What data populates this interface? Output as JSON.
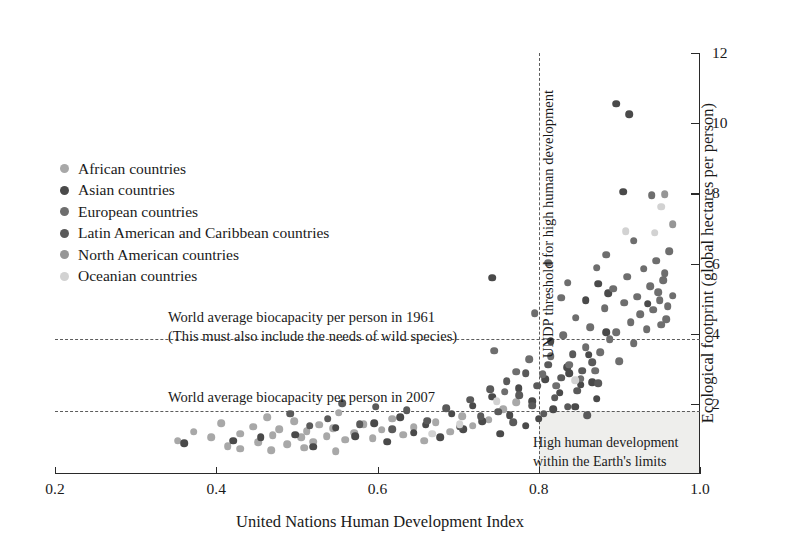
{
  "chart_data": {
    "type": "scatter",
    "title": "",
    "xlabel": "United Nations Human Development Index",
    "ylabel": "Ecological footprint (global hectares per person)",
    "xlim": [
      0.2,
      1.0
    ],
    "ylim": [
      0,
      12
    ],
    "xticks": [
      "0.2",
      "0.4",
      "0.6",
      "0.8",
      "1.0"
    ],
    "xtick_values": [
      0.2,
      0.4,
      0.6,
      0.8,
      1.0
    ],
    "yticks": [
      "2",
      "4",
      "6",
      "8",
      "10",
      "12"
    ],
    "ytick_values": [
      2,
      4,
      6,
      8,
      10,
      12
    ],
    "grid": false,
    "legend_position": "upper-left",
    "series": [
      {
        "name": "African countries",
        "color": "#a8a8a8",
        "points": [
          [
            0.352,
            0.95
          ],
          [
            0.372,
            1.2
          ],
          [
            0.394,
            1.05
          ],
          [
            0.406,
            1.45
          ],
          [
            0.414,
            0.8
          ],
          [
            0.43,
            1.15
          ],
          [
            0.446,
            1.35
          ],
          [
            0.452,
            0.9
          ],
          [
            0.463,
            1.62
          ],
          [
            0.47,
            1.1
          ],
          [
            0.478,
            1.28
          ],
          [
            0.488,
            0.85
          ],
          [
            0.497,
            1.5
          ],
          [
            0.505,
            1.05
          ],
          [
            0.512,
            1.22
          ],
          [
            0.52,
            0.92
          ],
          [
            0.528,
            1.4
          ],
          [
            0.537,
            1.08
          ],
          [
            0.545,
            1.3
          ],
          [
            0.552,
            1.75
          ],
          [
            0.56,
            0.98
          ],
          [
            0.571,
            1.18
          ],
          [
            0.583,
            1.42
          ],
          [
            0.594,
            1.02
          ],
          [
            0.605,
            1.26
          ],
          [
            0.618,
            1.58
          ],
          [
            0.632,
            1.12
          ],
          [
            0.645,
            1.34
          ],
          [
            0.658,
            0.95
          ],
          [
            0.672,
            1.48
          ],
          [
            0.69,
            1.2
          ],
          [
            0.705,
            1.65
          ],
          [
            0.718,
            1.38
          ],
          [
            0.738,
            1.55
          ],
          [
            0.756,
            1.85
          ],
          [
            0.772,
            2.05
          ],
          [
            0.43,
            0.72
          ],
          [
            0.468,
            0.68
          ],
          [
            0.509,
            0.75
          ],
          [
            0.548,
            0.65
          ]
        ]
      },
      {
        "name": "Asian countries",
        "color": "#4a4a4a",
        "points": [
          [
            0.36,
            0.88
          ],
          [
            0.421,
            0.95
          ],
          [
            0.455,
            1.05
          ],
          [
            0.498,
            1.12
          ],
          [
            0.52,
            0.78
          ],
          [
            0.548,
            1.32
          ],
          [
            0.572,
            1.08
          ],
          [
            0.596,
            1.45
          ],
          [
            0.612,
            0.92
          ],
          [
            0.628,
            1.62
          ],
          [
            0.645,
            1.18
          ],
          [
            0.66,
            1.4
          ],
          [
            0.678,
            1.05
          ],
          [
            0.692,
            1.72
          ],
          [
            0.706,
            1.28
          ],
          [
            0.718,
            1.95
          ],
          [
            0.73,
            1.5
          ],
          [
            0.742,
            2.2
          ],
          [
            0.752,
            1.15
          ],
          [
            0.764,
            1.68
          ],
          [
            0.775,
            2.45
          ],
          [
            0.784,
            1.38
          ],
          [
            0.792,
            2.08
          ],
          [
            0.8,
            1.58
          ],
          [
            0.808,
            2.7
          ],
          [
            0.818,
            1.85
          ],
          [
            0.826,
            2.32
          ],
          [
            0.835,
            3.05
          ],
          [
            0.845,
            1.92
          ],
          [
            0.852,
            2.55
          ],
          [
            0.862,
            3.4
          ],
          [
            0.872,
            2.15
          ],
          [
            0.884,
            4.05
          ],
          [
            0.896,
            10.55
          ],
          [
            0.912,
            10.25
          ],
          [
            0.905,
            8.05
          ],
          [
            0.858,
            4.95
          ],
          [
            0.874,
            5.42
          ],
          [
            0.886,
            5.15
          ],
          [
            0.935,
            4.85
          ],
          [
            0.742,
            5.6
          ],
          [
            0.815,
            3.78
          ],
          [
            0.838,
            2.88
          ],
          [
            0.866,
            2.62
          ]
        ]
      },
      {
        "name": "European countries",
        "color": "#6e6e6e",
        "points": [
          [
            0.805,
            2.85
          ],
          [
            0.815,
            3.35
          ],
          [
            0.822,
            2.52
          ],
          [
            0.83,
            3.95
          ],
          [
            0.838,
            3.12
          ],
          [
            0.846,
            4.45
          ],
          [
            0.852,
            2.72
          ],
          [
            0.858,
            3.62
          ],
          [
            0.864,
            4.18
          ],
          [
            0.87,
            2.95
          ],
          [
            0.876,
            3.48
          ],
          [
            0.882,
            4.72
          ],
          [
            0.888,
            3.85
          ],
          [
            0.892,
            5.28
          ],
          [
            0.896,
            4.05
          ],
          [
            0.9,
            3.22
          ],
          [
            0.906,
            4.88
          ],
          [
            0.91,
            5.62
          ],
          [
            0.914,
            4.32
          ],
          [
            0.918,
            3.72
          ],
          [
            0.922,
            5.05
          ],
          [
            0.926,
            4.55
          ],
          [
            0.93,
            5.85
          ],
          [
            0.934,
            4.12
          ],
          [
            0.938,
            5.35
          ],
          [
            0.942,
            4.68
          ],
          [
            0.946,
            6.08
          ],
          [
            0.95,
            4.95
          ],
          [
            0.954,
            5.52
          ],
          [
            0.958,
            4.42
          ],
          [
            0.94,
            7.95
          ],
          [
            0.948,
            5.18
          ],
          [
            0.952,
            4.25
          ],
          [
            0.956,
            5.72
          ],
          [
            0.96,
            4.78
          ],
          [
            0.962,
            6.35
          ],
          [
            0.966,
            5.08
          ],
          [
            0.884,
            6.25
          ],
          [
            0.872,
            5.88
          ],
          [
            0.828,
            5.02
          ],
          [
            0.795,
            4.58
          ],
          [
            0.788,
            3.28
          ],
          [
            0.772,
            2.92
          ],
          [
            0.758,
            2.35
          ],
          [
            0.745,
            3.52
          ],
          [
            0.812,
            6.02
          ],
          [
            0.836,
            5.45
          ],
          [
            0.918,
            6.65
          ]
        ]
      },
      {
        "name": "Latin American and Caribbean countries",
        "color": "#5a5a5a",
        "points": [
          [
            0.662,
            1.52
          ],
          [
            0.685,
            1.88
          ],
          [
            0.702,
            1.35
          ],
          [
            0.715,
            2.12
          ],
          [
            0.728,
            1.65
          ],
          [
            0.74,
            2.42
          ],
          [
            0.75,
            1.78
          ],
          [
            0.76,
            2.65
          ],
          [
            0.768,
            1.48
          ],
          [
            0.776,
            2.25
          ],
          [
            0.784,
            2.88
          ],
          [
            0.792,
            1.95
          ],
          [
            0.798,
            2.52
          ],
          [
            0.806,
            1.72
          ],
          [
            0.812,
            3.12
          ],
          [
            0.82,
            2.18
          ],
          [
            0.828,
            2.75
          ],
          [
            0.836,
            1.92
          ],
          [
            0.842,
            3.42
          ],
          [
            0.848,
            2.38
          ],
          [
            0.854,
            2.95
          ],
          [
            0.86,
            1.68
          ],
          [
            0.866,
            3.18
          ],
          [
            0.874,
            2.58
          ],
          [
            0.636,
            1.82
          ],
          [
            0.618,
            1.28
          ],
          [
            0.598,
            1.92
          ],
          [
            0.578,
            1.42
          ],
          [
            0.556,
            2.02
          ],
          [
            0.538,
            1.58
          ],
          [
            0.516,
            1.38
          ],
          [
            0.492,
            1.72
          ]
        ]
      },
      {
        "name": "North American countries",
        "color": "#969696",
        "points": [
          [
            0.956,
            7.98
          ],
          [
            0.966,
            7.12
          ]
        ]
      },
      {
        "name": "Oceanian countries",
        "color": "#d2d2d2",
        "points": [
          [
            0.944,
            6.88
          ],
          [
            0.952,
            7.62
          ],
          [
            0.908,
            6.92
          ],
          [
            0.748,
            2.08
          ],
          [
            0.702,
            1.42
          ],
          [
            0.668,
            1.15
          ],
          [
            0.845,
            2.68
          ]
        ]
      }
    ],
    "reference_lines": [
      {
        "name": "world-biocapacity-1961",
        "orientation": "horizontal",
        "value": 3.85,
        "style": "dashed",
        "label": "World average biocapacity per person in 1961\n(This must also include the needs of wild species)"
      },
      {
        "name": "world-biocapacity-2007",
        "orientation": "horizontal",
        "value": 1.8,
        "style": "dashed",
        "label": "World average biocapacity per person in 2007"
      },
      {
        "name": "undp-threshold",
        "orientation": "vertical",
        "value": 0.8,
        "style": "dashed",
        "label": "UNDP threshold for high human development"
      }
    ],
    "annotations": [
      {
        "name": "biocapacity-1961-note-line1",
        "text": "World average biocapacity per person in 1961"
      },
      {
        "name": "biocapacity-1961-note-line2",
        "text": "(This must also include the needs of wild species)"
      },
      {
        "name": "biocapacity-2007-note",
        "text": "World average biocapacity per person in 2007"
      },
      {
        "name": "undp-threshold-note",
        "text": "UNDP threshold for high human development"
      },
      {
        "name": "sustainable-quadrant-line1",
        "text": "High human development"
      },
      {
        "name": "sustainable-quadrant-line2",
        "text": "within the Earth's limits"
      }
    ],
    "shaded_region": {
      "name": "sustainable-development-quadrant",
      "x_from": 0.8,
      "x_to": 1.0,
      "y_from": 0.0,
      "y_to": 1.8,
      "color": "#eeeeec"
    }
  },
  "axes": {
    "x_title": "United Nations Human Development Index",
    "y_title": "Ecological footprint (global hectares per person)",
    "x_tick_labels": [
      "0.2",
      "0.4",
      "0.6",
      "0.8",
      "1.0"
    ],
    "y_tick_labels": [
      "2",
      "4",
      "6",
      "8",
      "10",
      "12"
    ]
  },
  "legend": {
    "items": [
      {
        "label": "African countries",
        "color": "#a8a8a8"
      },
      {
        "label": "Asian countries",
        "color": "#4a4a4a"
      },
      {
        "label": "European countries",
        "color": "#6e6e6e"
      },
      {
        "label": "Latin American and Caribbean countries",
        "color": "#5a5a5a"
      },
      {
        "label": "North American countries",
        "color": "#969696"
      },
      {
        "label": "Oceanian countries",
        "color": "#d2d2d2"
      }
    ]
  },
  "notes": {
    "biocapacity_1961_line1": "World average biocapacity per person in 1961",
    "biocapacity_1961_line2": "(This must also include the needs of wild species)",
    "biocapacity_2007": "World average biocapacity per person in 2007",
    "undp_threshold": "UNDP threshold for high human development",
    "quadrant_line1": "High human development",
    "quadrant_line2": "within the Earth's limits"
  }
}
